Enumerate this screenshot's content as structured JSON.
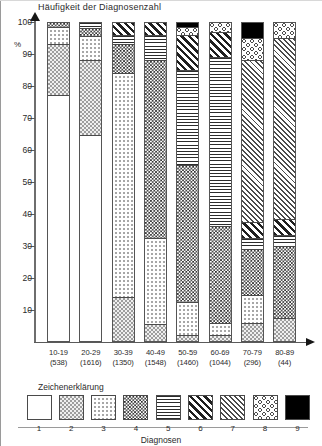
{
  "chart_data": {
    "type": "bar",
    "stacked": true,
    "title": "Häufigkeit der Diagnosenzahl",
    "xlabel": "Diagnosen",
    "ylabel": "%",
    "ylim": [
      0,
      100
    ],
    "yticks": [
      10,
      20,
      30,
      40,
      50,
      60,
      70,
      80,
      90,
      100
    ],
    "grid": false,
    "legend_position": "bottom",
    "legend_title": "Zeichenerklärung",
    "categories": [
      "10-19",
      "20-29",
      "30-39",
      "40-49",
      "50-59",
      "60-69",
      "70-79",
      "80-89"
    ],
    "category_counts": [
      "(538)",
      "(1616)",
      "(1350)",
      "(1548)",
      "(1460)",
      "(1044)",
      "(296)",
      "(44)"
    ],
    "series": [
      {
        "name": "1",
        "pattern": "empty",
        "values": [
          77.0,
          64.5,
          0.0,
          0.0,
          0.0,
          0.0,
          0.0,
          0.0
        ]
      },
      {
        "name": "2",
        "pattern": "checker-gray",
        "values": [
          16.0,
          23.5,
          13.5,
          5.0,
          1.5,
          1.5,
          5.5,
          7.0
        ]
      },
      {
        "name": "3",
        "pattern": "light-dots",
        "values": [
          5.5,
          7.5,
          70.5,
          27.0,
          10.5,
          4.0,
          8.5,
          0.0
        ]
      },
      {
        "name": "4",
        "pattern": "dense-checker",
        "values": [
          1.5,
          2.5,
          9.0,
          56.0,
          43.0,
          30.5,
          14.5,
          22.5
        ]
      },
      {
        "name": "5",
        "pattern": "horizontal-lines",
        "values": [
          0.0,
          2.0,
          3.0,
          8.0,
          30.0,
          53.0,
          3.5,
          3.5
        ]
      },
      {
        "name": "6",
        "pattern": "thick-diagonal",
        "values": [
          0.0,
          0.0,
          4.0,
          4.0,
          11.0,
          8.0,
          5.0,
          5.0
        ]
      },
      {
        "name": "7",
        "pattern": "fine-hatch",
        "values": [
          0.0,
          0.0,
          0.0,
          0.0,
          0.0,
          0.0,
          51.0,
          57.0
        ]
      },
      {
        "name": "8",
        "pattern": "circles",
        "values": [
          0.0,
          0.0,
          0.0,
          0.0,
          2.5,
          3.0,
          7.0,
          5.0
        ]
      },
      {
        "name": "9",
        "pattern": "solid-black",
        "values": [
          0.0,
          0.0,
          0.0,
          0.0,
          1.5,
          0.0,
          5.0,
          0.0
        ]
      }
    ],
    "legend_entries": [
      {
        "num": "1",
        "pattern": "empty"
      },
      {
        "num": "2",
        "pattern": "checker-gray"
      },
      {
        "num": "3",
        "pattern": "light-dots"
      },
      {
        "num": "4",
        "pattern": "dense-checker"
      },
      {
        "num": "5",
        "pattern": "horizontal-lines"
      },
      {
        "num": "6",
        "pattern": "thick-diagonal"
      },
      {
        "num": "7",
        "pattern": "fine-hatch"
      },
      {
        "num": "8",
        "pattern": "circles"
      },
      {
        "num": "9",
        "pattern": "solid-black"
      }
    ]
  },
  "axis": {
    "percent_symbol": "%"
  }
}
